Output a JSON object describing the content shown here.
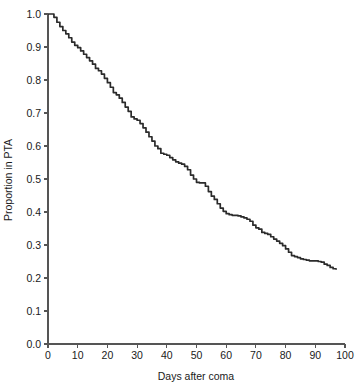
{
  "chart_data": {
    "type": "line",
    "subtype": "kaplan-meier-step",
    "title": "",
    "xlabel": "Days after coma",
    "ylabel": "Proportion in PTA",
    "xlim": [
      0,
      100
    ],
    "ylim": [
      0.0,
      1.0
    ],
    "xticks": [
      0,
      10,
      20,
      30,
      40,
      50,
      60,
      70,
      80,
      90,
      100
    ],
    "xtick_labels": [
      "0",
      "10",
      "20",
      "30",
      "40",
      "50",
      "60",
      "70",
      "80",
      "90",
      "100"
    ],
    "yticks": [
      0.0,
      0.1,
      0.2,
      0.3,
      0.4,
      0.5,
      0.6,
      0.7,
      0.8,
      0.9,
      1.0
    ],
    "ytick_labels": [
      "0.0",
      "0.1",
      "0.2",
      "0.3",
      "0.4",
      "0.5",
      "0.6",
      "0.7",
      "0.8",
      "0.9",
      "1.0"
    ],
    "grid": false,
    "legend": false,
    "legend_position": "none",
    "line_color": "#2b2b2b",
    "axis_color": "#555555",
    "background_color": "#ffffff",
    "series": [
      {
        "name": "Proportion in PTA",
        "x": [
          0,
          1,
          2,
          3,
          4,
          5,
          6,
          7,
          8,
          9,
          10,
          11,
          12,
          13,
          14,
          15,
          16,
          17,
          18,
          19,
          20,
          21,
          22,
          23,
          24,
          25,
          26,
          27,
          28,
          29,
          30,
          31,
          32,
          33,
          34,
          35,
          36,
          37,
          38,
          39,
          40,
          41,
          42,
          43,
          44,
          45,
          46,
          47,
          48,
          49,
          50,
          51,
          52,
          53,
          54,
          55,
          56,
          57,
          58,
          59,
          60,
          61,
          62,
          63,
          64,
          65,
          66,
          67,
          68,
          69,
          70,
          71,
          72,
          73,
          74,
          75,
          76,
          77,
          78,
          79,
          80,
          81,
          82,
          83,
          84,
          85,
          86,
          87,
          88,
          89,
          90,
          91,
          92,
          93,
          94,
          95,
          96,
          97
        ],
        "y": [
          1.0,
          1.0,
          0.99,
          0.975,
          0.962,
          0.95,
          0.94,
          0.928,
          0.915,
          0.905,
          0.898,
          0.888,
          0.878,
          0.868,
          0.858,
          0.848,
          0.835,
          0.828,
          0.818,
          0.805,
          0.792,
          0.778,
          0.762,
          0.755,
          0.745,
          0.732,
          0.718,
          0.705,
          0.688,
          0.682,
          0.678,
          0.668,
          0.655,
          0.642,
          0.628,
          0.615,
          0.6,
          0.592,
          0.578,
          0.575,
          0.572,
          0.565,
          0.558,
          0.552,
          0.548,
          0.545,
          0.538,
          0.528,
          0.512,
          0.5,
          0.49,
          0.488,
          0.488,
          0.478,
          0.462,
          0.448,
          0.438,
          0.425,
          0.412,
          0.402,
          0.395,
          0.392,
          0.39,
          0.39,
          0.388,
          0.385,
          0.382,
          0.378,
          0.372,
          0.36,
          0.352,
          0.348,
          0.338,
          0.335,
          0.332,
          0.325,
          0.318,
          0.312,
          0.305,
          0.298,
          0.288,
          0.278,
          0.268,
          0.265,
          0.262,
          0.258,
          0.256,
          0.254,
          0.252,
          0.252,
          0.252,
          0.25,
          0.248,
          0.242,
          0.238,
          0.232,
          0.228,
          0.225
        ]
      }
    ],
    "annotations": []
  }
}
